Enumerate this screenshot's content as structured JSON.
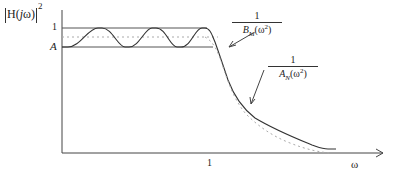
{
  "diagram": {
    "title": "",
    "y_axis_label": {
      "prefix": "H(",
      "j": "j",
      "w": "ω",
      "suffix": ")",
      "power": "2"
    },
    "y_ticks": {
      "one": "1",
      "A": "A"
    },
    "x_ticks": {
      "one": "1"
    },
    "x_axis_label": "ω",
    "annotations": {
      "B": {
        "numerator": "1",
        "denominator_base": "B",
        "denominator_sub": "M",
        "denominator_arg": "(ω",
        "denominator_pow": "2",
        "denominator_close": ")"
      },
      "A": {
        "numerator": "1",
        "denominator_base": "A",
        "denominator_sub": "N",
        "denominator_arg": "(ω",
        "denominator_pow": "2",
        "denominator_close": ")"
      }
    },
    "colors": {
      "line": "#333333",
      "dotted": "#aaaaaa",
      "background": "#ffffff"
    }
  }
}
